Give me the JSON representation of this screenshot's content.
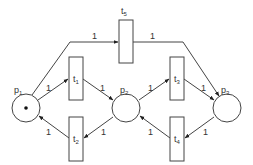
{
  "diagram": {
    "type": "petri-net",
    "places": [
      {
        "id": "p1",
        "label": "p",
        "sub": "1",
        "tokens": 1
      },
      {
        "id": "p2",
        "label": "p",
        "sub": "2",
        "tokens": 0
      },
      {
        "id": "p3",
        "label": "p",
        "sub": "3",
        "tokens": 0
      }
    ],
    "transitions": [
      {
        "id": "t1",
        "label": "t",
        "sub": "1"
      },
      {
        "id": "t2",
        "label": "t",
        "sub": "2"
      },
      {
        "id": "t3",
        "label": "t",
        "sub": "3"
      },
      {
        "id": "t4",
        "label": "t",
        "sub": "4"
      },
      {
        "id": "t5",
        "label": "t",
        "sub": "5"
      }
    ],
    "arcs": [
      {
        "from": "p1",
        "to": "t5",
        "weight": "1"
      },
      {
        "from": "t5",
        "to": "p3",
        "weight": "1"
      },
      {
        "from": "p1",
        "to": "t1",
        "weight": "1"
      },
      {
        "from": "t1",
        "to": "p2",
        "weight": "1"
      },
      {
        "from": "p2",
        "to": "t2",
        "weight": "1"
      },
      {
        "from": "t2",
        "to": "p1",
        "weight": "1"
      },
      {
        "from": "p2",
        "to": "t3",
        "weight": "1"
      },
      {
        "from": "t3",
        "to": "p3",
        "weight": "1"
      },
      {
        "from": "p3",
        "to": "t4",
        "weight": "1"
      },
      {
        "from": "t4",
        "to": "p2",
        "weight": "1"
      }
    ]
  }
}
